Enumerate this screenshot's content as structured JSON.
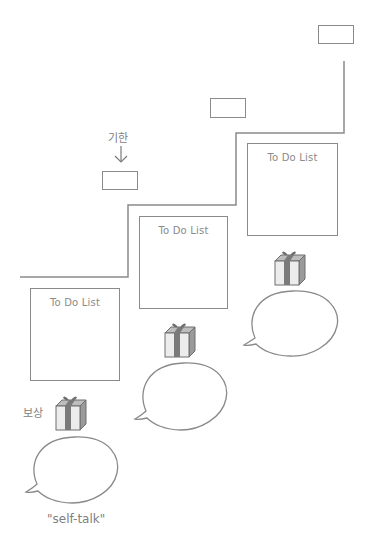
{
  "diagram": {
    "deadline_label": "기한",
    "reward_label": "보상",
    "self_talk_label": "\"self-talk\"",
    "todo_boxes": [
      {
        "title": "To Do List"
      },
      {
        "title": "To Do List"
      },
      {
        "title": "To Do List"
      }
    ],
    "deadline_boxes": 3,
    "gifts": 3,
    "speech_bubbles": 3,
    "colors": {
      "line": "#8a8a8a",
      "text": "#808080",
      "gift_body": "#e8e8e8",
      "gift_ribbon": "#6e6e6e"
    }
  }
}
